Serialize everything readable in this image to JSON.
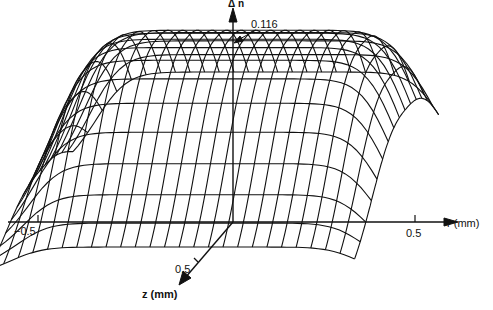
{
  "chart_data": {
    "type": "surface-wireframe",
    "title": "",
    "zlabel": "Δn",
    "xlabel": "r (mm)",
    "ylabel": "z (mm)",
    "peak_annotation": "0.116",
    "peak_value": 0.116,
    "r_ticks": [
      {
        "value": -0.5,
        "label": "-0.5"
      },
      {
        "value": 0.5,
        "label": "0.5"
      }
    ],
    "z_ticks": [
      {
        "value": 0.5,
        "label": "0.5"
      }
    ],
    "r_range": [
      -0.52,
      0.45
    ],
    "z_range": [
      -0.45,
      0.6
    ],
    "r_lines": 26,
    "z_lines": 16,
    "grid": false,
    "color": "#111111"
  },
  "labels": {
    "dn_axis": "Δ n",
    "peak": "0.116",
    "r_neg": "−0.5",
    "r_pos": "0.5",
    "r_axis": "r  (mm)",
    "z_tick": "0.5",
    "z_axis": "z  (mm)"
  }
}
